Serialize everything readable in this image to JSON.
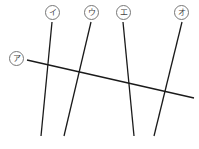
{
  "diagram": {
    "line_color": "#1a1a1a",
    "labels": [
      {
        "id": "a",
        "text": "ア",
        "x": 9,
        "y": 51
      },
      {
        "id": "i",
        "text": "イ",
        "x": 45,
        "y": 5
      },
      {
        "id": "u",
        "text": "ウ",
        "x": 84,
        "y": 5
      },
      {
        "id": "e",
        "text": "エ",
        "x": 116,
        "y": 5
      },
      {
        "id": "o",
        "text": "オ",
        "x": 174,
        "y": 5
      }
    ],
    "lines": [
      {
        "label": "ア",
        "x1": 27,
        "y1": 60,
        "x2": 194,
        "y2": 98
      },
      {
        "label": "イ",
        "x1": 52,
        "y1": 22,
        "x2": 41,
        "y2": 136
      },
      {
        "label": "ウ",
        "x1": 91,
        "y1": 22,
        "x2": 64,
        "y2": 136
      },
      {
        "label": "エ",
        "x1": 123,
        "y1": 22,
        "x2": 134,
        "y2": 136
      },
      {
        "label": "オ",
        "x1": 182,
        "y1": 22,
        "x2": 154,
        "y2": 136
      }
    ]
  }
}
